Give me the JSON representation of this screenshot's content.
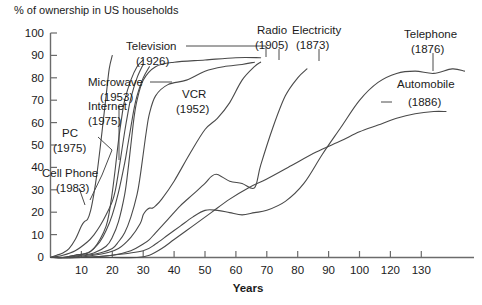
{
  "chart_data": {
    "type": "line",
    "title": "% of ownership in US households",
    "xlabel": "Years",
    "ylabel": "",
    "xlim": [
      0,
      137
    ],
    "ylim": [
      0,
      100
    ],
    "grid": false,
    "legend_position": "inline-annotations",
    "x_ticks": [
      "0",
      "10",
      "20",
      "30",
      "40",
      "50",
      "60",
      "70",
      "80",
      "90",
      "100",
      "120",
      "130"
    ],
    "x_tick_values": [
      0,
      10,
      20,
      30,
      40,
      50,
      60,
      70,
      80,
      90,
      100,
      110,
      120,
      130
    ],
    "y_ticks": [
      "0",
      "10",
      "20",
      "30",
      "40",
      "50",
      "60",
      "70",
      "80",
      "90",
      "100"
    ],
    "y_tick_values": [
      0,
      10,
      20,
      30,
      40,
      50,
      60,
      70,
      80,
      90,
      100
    ],
    "axis_note": "x tick after 100 is labeled 120 in the source image (110 is skipped)",
    "series": [
      {
        "name": "Cell Phone",
        "label": "Cell Phone",
        "year": "(1983)",
        "x": [
          0,
          2,
          4,
          6,
          8,
          10,
          11,
          12,
          13,
          14,
          15,
          16,
          17,
          18,
          19,
          20
        ],
        "values": [
          0,
          1,
          2,
          4,
          8,
          14,
          16,
          17,
          21,
          28,
          37,
          48,
          60,
          72,
          84,
          90
        ]
      },
      {
        "name": "PC",
        "label": "PC",
        "year": "(1975)",
        "x": [
          0,
          4,
          8,
          12,
          14,
          16,
          18,
          20,
          21,
          22,
          23,
          24,
          25,
          26,
          28,
          30
        ],
        "values": [
          0,
          1,
          3,
          7,
          10,
          14,
          19,
          25,
          30,
          38,
          47,
          56,
          64,
          71,
          80,
          86
        ]
      },
      {
        "name": "Internet",
        "label": "Internet",
        "year": "(1975)",
        "x": [
          0,
          4,
          8,
          12,
          14,
          16,
          18,
          19,
          20,
          21,
          22,
          23,
          24,
          26,
          28,
          30
        ],
        "values": [
          0,
          0,
          1,
          2,
          4,
          8,
          14,
          20,
          29,
          40,
          52,
          62,
          70,
          79,
          85,
          88
        ]
      },
      {
        "name": "Microwave",
        "label": "Microwave",
        "year": "(1953)",
        "x": [
          0,
          4,
          8,
          12,
          14,
          16,
          18,
          20,
          22,
          24,
          25,
          26,
          27,
          28,
          30,
          32
        ],
        "values": [
          0,
          0,
          1,
          2,
          4,
          7,
          12,
          19,
          29,
          42,
          50,
          58,
          66,
          72,
          80,
          85
        ]
      },
      {
        "name": "Television",
        "label": "Television",
        "year": "(1926)",
        "x": [
          0,
          5,
          10,
          14,
          18,
          20,
          22,
          24,
          25,
          26,
          27,
          28,
          30,
          34,
          40,
          50,
          60,
          68
        ],
        "values": [
          0,
          0,
          1,
          2,
          5,
          9,
          16,
          28,
          38,
          50,
          62,
          70,
          79,
          85,
          87,
          88,
          89,
          89
        ]
      },
      {
        "name": "VCR",
        "label": "VCR",
        "year": "(1952)",
        "x": [
          0,
          6,
          12,
          16,
          20,
          22,
          24,
          26,
          28,
          29,
          30,
          31,
          32,
          34,
          38,
          44,
          50,
          56,
          62,
          66
        ],
        "values": [
          0,
          0,
          1,
          2,
          4,
          7,
          11,
          18,
          28,
          36,
          46,
          56,
          64,
          72,
          77,
          79,
          83,
          85,
          86,
          87
        ]
      },
      {
        "name": "Radio",
        "label": "Radio",
        "year": "(1905)",
        "x": [
          0,
          8,
          14,
          18,
          22,
          26,
          29,
          30,
          31,
          32,
          33,
          34,
          36,
          40,
          45,
          50,
          54,
          58,
          62,
          66,
          68
        ],
        "values": [
          0,
          0,
          1,
          2,
          4,
          9,
          15,
          19,
          21,
          22,
          22,
          23,
          26,
          34,
          46,
          57,
          62,
          69,
          79,
          85,
          87
        ]
      },
      {
        "name": "Electricity",
        "label": "Electricity",
        "year": "(1873)",
        "x": [
          0,
          10,
          20,
          26,
          30,
          32,
          34,
          38,
          42,
          46,
          50,
          52,
          54,
          58,
          62,
          66,
          68,
          72,
          76,
          80,
          83
        ],
        "values": [
          0,
          0,
          1,
          3,
          6,
          8,
          11,
          17,
          23,
          28,
          33,
          36,
          37,
          34,
          33,
          31,
          41,
          58,
          72,
          80,
          84
        ]
      },
      {
        "name": "Telephone",
        "label": "Telephone",
        "year": "(1876)",
        "x": [
          0,
          10,
          20,
          30,
          34,
          38,
          42,
          46,
          50,
          54,
          58,
          62,
          66,
          70,
          76,
          82,
          88,
          94,
          100,
          106,
          112,
          118,
          124,
          130,
          134
        ],
        "values": [
          0,
          0,
          1,
          3,
          6,
          10,
          14,
          18,
          21,
          21,
          20,
          19,
          20,
          21,
          25,
          33,
          46,
          58,
          70,
          78,
          82,
          83,
          82,
          84,
          83
        ]
      },
      {
        "name": "Automobile",
        "label": "Automobile",
        "year": "(1886)",
        "x": [
          0,
          10,
          20,
          28,
          32,
          36,
          40,
          46,
          52,
          58,
          64,
          70,
          78,
          86,
          94,
          100,
          106,
          112,
          118,
          124,
          128
        ],
        "values": [
          0,
          0,
          0,
          0,
          1,
          4,
          8,
          14,
          20,
          26,
          31,
          35,
          41,
          47,
          52,
          56,
          59,
          62,
          64,
          65,
          65
        ]
      }
    ],
    "annotations": [
      {
        "name": "annotation-television",
        "label": "Television",
        "year": "(1926)"
      },
      {
        "name": "annotation-microwave",
        "label": "Microwave",
        "year": "(1953)"
      },
      {
        "name": "annotation-internet",
        "label": "Internet",
        "year": "(1975)"
      },
      {
        "name": "annotation-vcr",
        "label": "VCR",
        "year": "(1952)"
      },
      {
        "name": "annotation-pc",
        "label": "PC",
        "year": "(1975)"
      },
      {
        "name": "annotation-cell-phone",
        "label": "Cell Phone",
        "year": "(1983)"
      },
      {
        "name": "annotation-radio",
        "label": "Radio",
        "year": "(1905)"
      },
      {
        "name": "annotation-electricity",
        "label": "Electricity",
        "year": "(1873)"
      },
      {
        "name": "annotation-telephone",
        "label": "Telephone",
        "year": "(1876)"
      },
      {
        "name": "annotation-automobile",
        "label": "Automobile",
        "year": "(1886)"
      }
    ]
  },
  "labels": {
    "title": "% of ownership in US households",
    "xaxis_title": "Years",
    "television": "Television",
    "television_year": "(1926)",
    "microwave": "Microwave",
    "microwave_year": "(1953)",
    "internet": "Internet",
    "internet_year": "(1975)",
    "vcr": "VCR",
    "vcr_year": "(1952)",
    "pc": "PC",
    "pc_year": "(1975)",
    "cellphone": "Cell Phone",
    "cellphone_year": "(1983)",
    "radio": "Radio",
    "radio_year": "(1905)",
    "electricity": "Electricity",
    "electricity_year": "(1873)",
    "telephone": "Telephone",
    "telephone_year": "(1876)",
    "automobile": "Automobile",
    "automobile_year": "(1886)"
  },
  "ytick_labels": [
    "100",
    "90",
    "80",
    "70",
    "60",
    "50",
    "40",
    "30",
    "20",
    "10",
    "0"
  ],
  "xtick_labels": [
    "10",
    "20",
    "30",
    "40",
    "50",
    "60",
    "70",
    "80",
    "90",
    "100",
    "120",
    "130"
  ],
  "colors": {
    "line": "#4a4a4a",
    "axis": "#6b6b6b",
    "text": "#1b1b1b",
    "background": "#ffffff"
  }
}
